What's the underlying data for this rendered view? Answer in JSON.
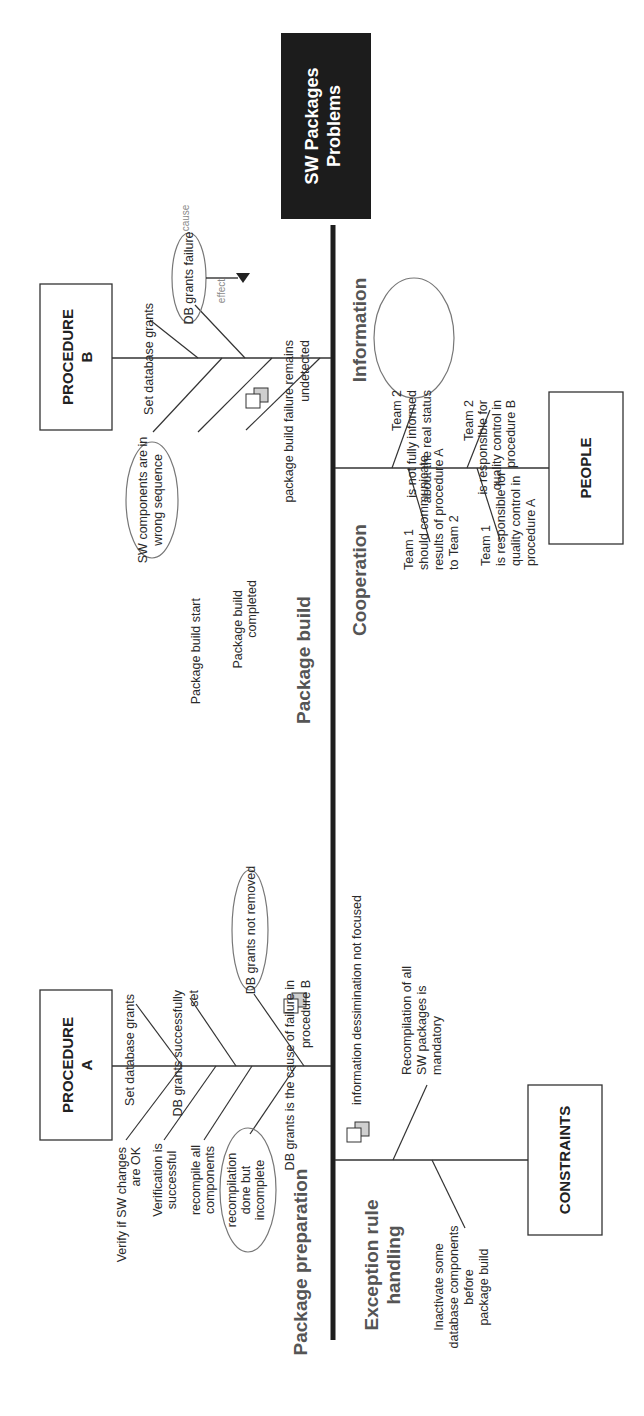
{
  "head": {
    "line1": "SW Packages",
    "line2": "Problems"
  },
  "boxes": {
    "procedure_b": {
      "line1": "PROCEDURE",
      "line2": "B"
    },
    "procedure_a": {
      "line1": "PROCEDURE",
      "line2": "A"
    },
    "people": {
      "label": "PEOPLE"
    },
    "constraints": {
      "label": "CONSTRAINTS"
    }
  },
  "categories": {
    "package_build": "Package build",
    "package_preparation": "Package preparation",
    "information": "Information",
    "cooperation": "Cooperation",
    "exception_line1": "Exception rule",
    "exception_line2": "handling"
  },
  "procedure_b_causes": {
    "set_grants": "Set database grants",
    "db_grants_failure": "DB grants failure",
    "cause_label": "cause",
    "effect_label": "effect",
    "effect_line1": "package build failure remains",
    "effect_line2": "undetected",
    "sw_components_line1": "SW components are in",
    "sw_components_line2": "wrong sequence",
    "build_start": "Package build start",
    "build_completed_line1": "Package build",
    "build_completed_line2": "completed"
  },
  "procedure_a_causes": {
    "set_grants": "Set database grants",
    "grants_set_line1": "DB grants successfully",
    "grants_set_line2": "set",
    "grants_not_removed": "DB grants not removed",
    "grants_cause_line1": "DB grants is the cause of failure in",
    "grants_cause_line2": "procedure B",
    "verify_line1": "Verify if SW changes",
    "verify_line2": "are OK",
    "verification_line1": "Verification is",
    "verification_line2": "successful",
    "recompile_line1": "recompile all",
    "recompile_line2": "components",
    "recompilation_line1": "recompilation",
    "recompilation_line2": "done but",
    "recompilation_line3": "incomplete"
  },
  "people_causes": {
    "team2_info_line1": "Team 2",
    "team2_info_line2": "is not fully informed",
    "team2_info_line3": "about the real status",
    "team2_resp_line1": "Team 2",
    "team2_resp_line2": "is responsible for",
    "team2_resp_line3": "quality control in",
    "team2_resp_line4": "procedure B",
    "team1_comm_line1": "Team 1",
    "team1_comm_line2": "should communicate",
    "team1_comm_line3": "results of procedure A",
    "team1_comm_line4": "to Team 2",
    "team1_resp_line1": "Team 1",
    "team1_resp_line2": "is responsible for",
    "team1_resp_line3": "quality control in",
    "team1_resp_line4": "procedure A"
  },
  "constraints_causes": {
    "info_not_focused": "information dessimination not focused",
    "recompilation_line1": "Recompilation of all",
    "recompilation_line2": "SW packages is",
    "recompilation_line3": "mandatory",
    "inactivate_line1": "Inactivate some",
    "inactivate_line2": "database components",
    "inactivate_line3": "before",
    "inactivate_line4": "package build"
  },
  "icons": [
    "note-icon",
    "note-icon",
    "note-icon",
    "note-icon"
  ]
}
